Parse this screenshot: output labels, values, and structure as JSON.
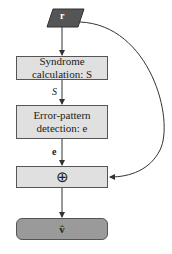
{
  "diagram": {
    "input": {
      "label": "r"
    },
    "syndrome_box": {
      "line1": "Syndrome",
      "line2": "calculation: S"
    },
    "edge_syndrome": "S",
    "error_box": {
      "line1": "Error-pattern",
      "line2": "detection: e"
    },
    "edge_error": "e",
    "adder": {
      "symbol": "⊕"
    },
    "output": {
      "label": "v̂"
    },
    "colors": {
      "input_fill": "#555555",
      "box_fill": "#e0e0e0",
      "output_fill": "#9a9a9a",
      "line": "#333333"
    }
  }
}
